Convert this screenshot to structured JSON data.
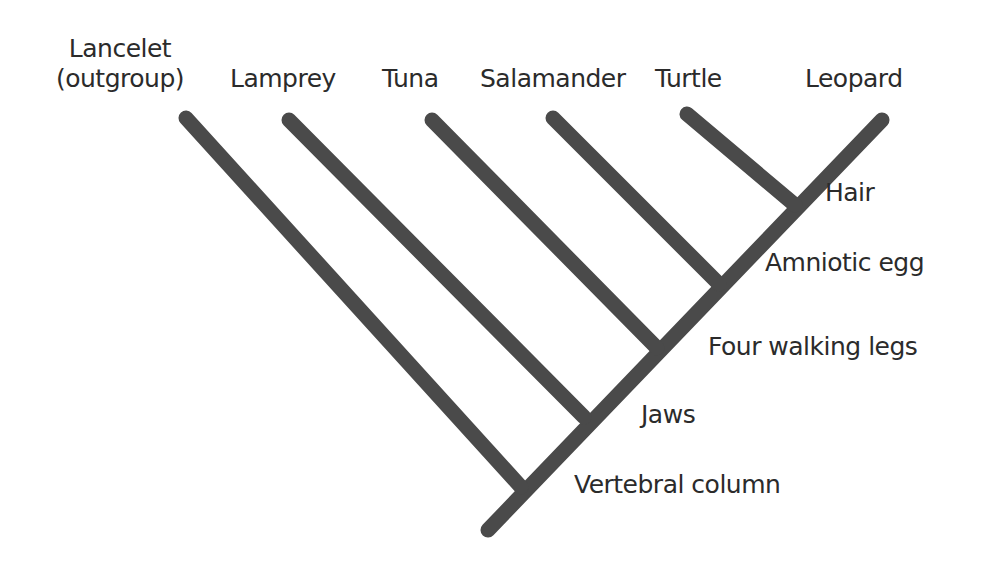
{
  "diagram": {
    "type": "cladogram",
    "line_color": "#4a4a4a",
    "taxa": [
      {
        "name": "Lancelet\n(outgroup)",
        "line1": "Lancelet",
        "line2": "(outgroup)"
      },
      {
        "name": "Lamprey"
      },
      {
        "name": "Tuna"
      },
      {
        "name": "Salamander"
      },
      {
        "name": "Turtle"
      },
      {
        "name": "Leopard"
      }
    ],
    "characters": [
      {
        "name": "Vertebral column"
      },
      {
        "name": "Jaws"
      },
      {
        "name": "Four walking legs"
      },
      {
        "name": "Amniotic egg"
      },
      {
        "name": "Hair"
      }
    ]
  }
}
